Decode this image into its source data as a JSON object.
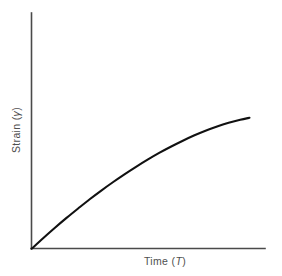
{
  "figure": {
    "type": "line-plot",
    "background_color": "#ffffff",
    "axis_color": "#4a4a4a",
    "curve_color": "#111111"
  },
  "axes": {
    "y": {
      "label_prefix": "Strain (",
      "label_symbol": "γ",
      "label_suffix": ")",
      "label_full": "Strain (γ)",
      "orientation": "vertical",
      "ticks": [],
      "tick_labels": []
    },
    "x": {
      "label_prefix": "Time (",
      "label_symbol": "T",
      "label_suffix": ")",
      "label_full": "Time (T)",
      "orientation": "horizontal",
      "ticks": [],
      "tick_labels": []
    }
  },
  "chart_data": {
    "type": "line",
    "title": "",
    "subtitle": "",
    "xlabel": "Time (T)",
    "ylabel": "Strain (γ)",
    "xlim": [
      0,
      1
    ],
    "ylim": [
      0,
      1
    ],
    "grid": false,
    "legend": null,
    "legend_position": "none",
    "annotations": [],
    "series": [
      {
        "name": "Creep strain",
        "x": [
          0.0,
          0.05,
          0.1,
          0.15,
          0.2,
          0.25,
          0.3,
          0.35,
          0.4,
          0.45,
          0.5,
          0.55,
          0.6,
          0.65,
          0.7,
          0.75,
          0.8,
          0.85,
          0.9,
          0.94
        ],
        "y": [
          0.0,
          0.055,
          0.108,
          0.159,
          0.208,
          0.256,
          0.301,
          0.344,
          0.385,
          0.424,
          0.461,
          0.496,
          0.528,
          0.558,
          0.586,
          0.611,
          0.633,
          0.652,
          0.668,
          0.678
        ]
      }
    ]
  }
}
